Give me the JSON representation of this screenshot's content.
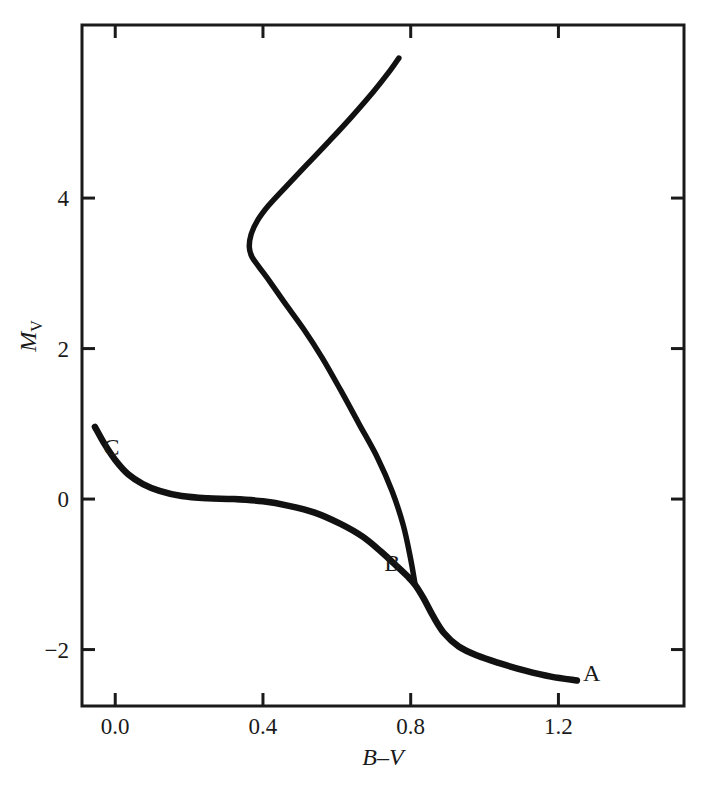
{
  "chart_data": {
    "type": "line",
    "title": "",
    "xlabel": "B-V",
    "ylabel": "M_V",
    "ylabel_base": "M",
    "ylabel_sub": "V",
    "xlim": [
      -0.09,
      1.54
    ],
    "ylim": [
      6.3,
      -2.75
    ],
    "y_inverted": true,
    "grid": false,
    "legend": "none",
    "xticks": [
      0.0,
      0.4,
      0.8,
      1.2
    ],
    "xtick_labels": [
      "0.0",
      "0.4",
      "0.8",
      "1.2"
    ],
    "yticks": [
      -2,
      0,
      2,
      4
    ],
    "ytick_labels": [
      "-2",
      "0",
      "2",
      "4"
    ],
    "annotations": [
      {
        "text": "A",
        "x": 1.29,
        "y": -2.42,
        "name": "label-a"
      },
      {
        "text": "B",
        "x": 0.75,
        "y": -0.95,
        "name": "label-b"
      },
      {
        "text": "C",
        "x": -0.01,
        "y": 0.59,
        "name": "label-c"
      }
    ],
    "series": [
      {
        "name": "giant-subgiant-branch",
        "comment": "Runs from C (blue end of subgiant branch) through turnoff B up the red giant branch to A",
        "points": [
          [
            -0.055,
            0.96
          ],
          [
            -0.03,
            0.74
          ],
          [
            0.0,
            0.52
          ],
          [
            0.035,
            0.33
          ],
          [
            0.075,
            0.2
          ],
          [
            0.12,
            0.11
          ],
          [
            0.18,
            0.04
          ],
          [
            0.25,
            0.01
          ],
          [
            0.32,
            0.0
          ],
          [
            0.4,
            -0.03
          ],
          [
            0.47,
            -0.09
          ],
          [
            0.54,
            -0.18
          ],
          [
            0.61,
            -0.33
          ],
          [
            0.67,
            -0.5
          ],
          [
            0.72,
            -0.7
          ],
          [
            0.76,
            -0.88
          ],
          [
            0.79,
            -1.02
          ],
          [
            0.812,
            -1.14
          ],
          [
            0.835,
            -1.32
          ],
          [
            0.86,
            -1.55
          ],
          [
            0.89,
            -1.78
          ],
          [
            0.93,
            -1.96
          ],
          [
            0.98,
            -2.08
          ],
          [
            1.04,
            -2.18
          ],
          [
            1.11,
            -2.28
          ],
          [
            1.18,
            -2.36
          ],
          [
            1.25,
            -2.41
          ]
        ]
      },
      {
        "name": "main-sequence",
        "comment": "Descends from turnoff B leftwards to the bend then down-right to faint end",
        "points": [
          [
            0.812,
            -1.14
          ],
          [
            0.8,
            -0.8
          ],
          [
            0.78,
            -0.35
          ],
          [
            0.75,
            0.1
          ],
          [
            0.71,
            0.55
          ],
          [
            0.66,
            1.0
          ],
          [
            0.61,
            1.45
          ],
          [
            0.56,
            1.88
          ],
          [
            0.51,
            2.26
          ],
          [
            0.46,
            2.6
          ],
          [
            0.42,
            2.88
          ],
          [
            0.39,
            3.08
          ],
          [
            0.37,
            3.22
          ],
          [
            0.363,
            3.35
          ],
          [
            0.368,
            3.52
          ],
          [
            0.385,
            3.7
          ],
          [
            0.415,
            3.9
          ],
          [
            0.46,
            4.14
          ],
          [
            0.52,
            4.45
          ],
          [
            0.58,
            4.76
          ],
          [
            0.64,
            5.08
          ],
          [
            0.7,
            5.42
          ],
          [
            0.745,
            5.7
          ],
          [
            0.768,
            5.86
          ]
        ]
      }
    ]
  },
  "figure": {
    "plot_area": {
      "left": 82,
      "top": 25,
      "right": 684,
      "bottom": 706
    },
    "line_color": "#111111",
    "axis_color": "#1a1a1a",
    "background": "#ffffff"
  }
}
